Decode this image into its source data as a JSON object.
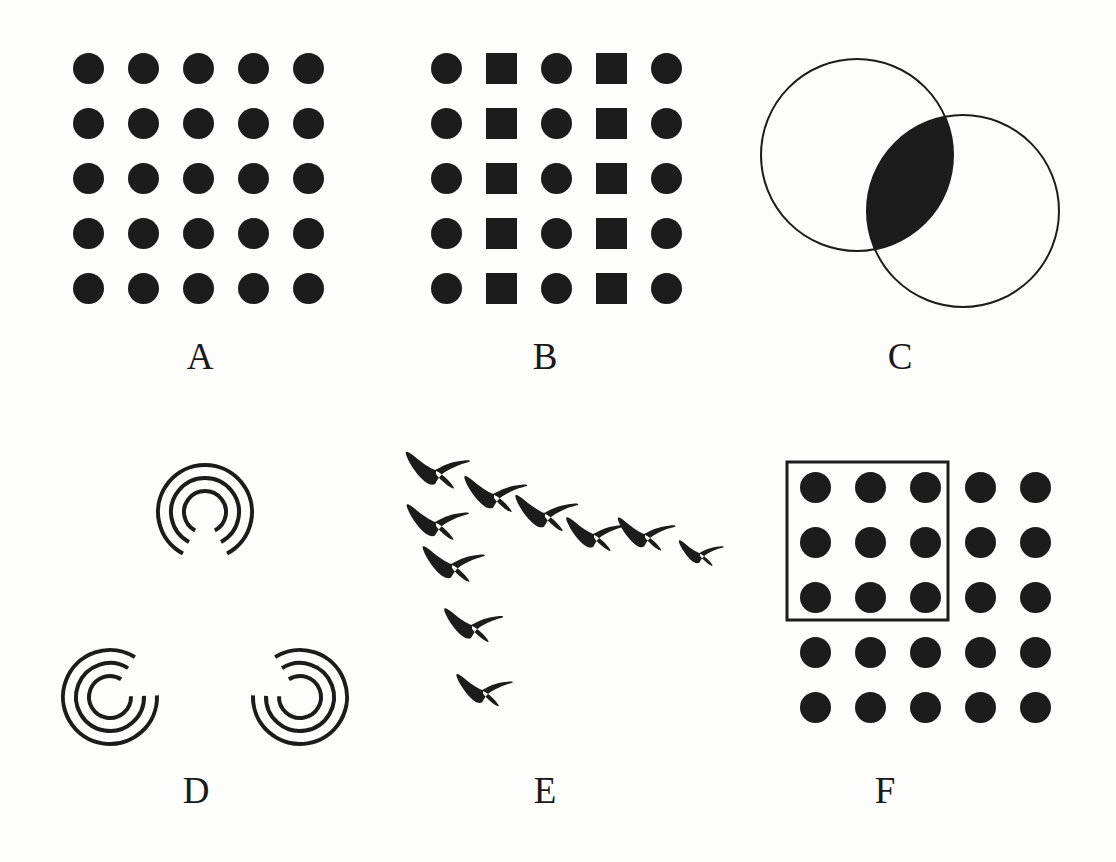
{
  "figure": {
    "background_color": "#fdfdfc",
    "ink_color": "#1c1c1c",
    "width": 1116,
    "height": 862
  },
  "panels": [
    {
      "id": "A",
      "label": "A",
      "label_x": 170,
      "label_y": 338,
      "type": "dot-grid",
      "description": "5 by 5 grid of identical filled circles",
      "origin_x": 88,
      "origin_y": 68,
      "col_step": 55,
      "row_step": 55,
      "rows": 5,
      "cols": 5,
      "marker_size": 31,
      "cell_shapes": [
        [
          "circle",
          "circle",
          "circle",
          "circle",
          "circle"
        ],
        [
          "circle",
          "circle",
          "circle",
          "circle",
          "circle"
        ],
        [
          "circle",
          "circle",
          "circle",
          "circle",
          "circle"
        ],
        [
          "circle",
          "circle",
          "circle",
          "circle",
          "circle"
        ],
        [
          "circle",
          "circle",
          "circle",
          "circle",
          "circle"
        ]
      ]
    },
    {
      "id": "B",
      "label": "B",
      "label_x": 515,
      "label_y": 338,
      "type": "dot-grid",
      "description": "5 by 5 grid alternating columns of circles and squares",
      "origin_x": 446,
      "origin_y": 68,
      "col_step": 55,
      "row_step": 55,
      "rows": 5,
      "cols": 5,
      "marker_size": 31,
      "cell_shapes": [
        [
          "circle",
          "square",
          "circle",
          "square",
          "circle"
        ],
        [
          "circle",
          "square",
          "circle",
          "square",
          "circle"
        ],
        [
          "circle",
          "square",
          "circle",
          "square",
          "circle"
        ],
        [
          "circle",
          "square",
          "circle",
          "square",
          "circle"
        ],
        [
          "circle",
          "square",
          "circle",
          "square",
          "circle"
        ]
      ]
    },
    {
      "id": "C",
      "label": "C",
      "label_x": 870,
      "label_y": 338,
      "type": "venn",
      "description": "Two overlapping outlined circles with filled lens intersection",
      "circles": [
        {
          "cx": 857,
          "cy": 155,
          "r": 96
        },
        {
          "cx": 963,
          "cy": 211,
          "r": 96
        }
      ],
      "stroke_width": 2,
      "intersection_filled": true
    },
    {
      "id": "D",
      "label": "D",
      "label_x": 166,
      "label_y": 772,
      "type": "arc-triad",
      "description": "Three concentric-arc inducers forming an illusory triangle",
      "elements": [
        {
          "cx": 205,
          "cy": 512,
          "gap_center_deg": 90,
          "radii": [
            21,
            34,
            47
          ],
          "gap_deg": 56
        },
        {
          "cx": 110,
          "cy": 697,
          "gap_center_deg": 330,
          "radii": [
            21,
            34,
            47
          ],
          "gap_deg": 56
        },
        {
          "cx": 300,
          "cy": 697,
          "gap_center_deg": 210,
          "radii": [
            21,
            34,
            47
          ],
          "gap_deg": 56
        }
      ],
      "stroke_width": 4
    },
    {
      "id": "E",
      "label": "E",
      "label_x": 515,
      "label_y": 772,
      "type": "bird-flock",
      "description": "Ten bird silhouettes arranged in a V formation",
      "birds": [
        {
          "x": 436,
          "y": 470,
          "scale": 1.0
        },
        {
          "x": 494,
          "y": 494,
          "scale": 0.98
        },
        {
          "x": 436,
          "y": 522,
          "scale": 0.97
        },
        {
          "x": 545,
          "y": 513,
          "scale": 0.98
        },
        {
          "x": 594,
          "y": 534,
          "scale": 0.92
        },
        {
          "x": 645,
          "y": 534,
          "scale": 0.9
        },
        {
          "x": 452,
          "y": 564,
          "scale": 0.97
        },
        {
          "x": 700,
          "y": 553,
          "scale": 0.7
        },
        {
          "x": 472,
          "y": 625,
          "scale": 0.92
        },
        {
          "x": 483,
          "y": 690,
          "scale": 0.88
        }
      ]
    },
    {
      "id": "F",
      "label": "F",
      "label_x": 855,
      "label_y": 772,
      "type": "dot-grid-with-frame",
      "description": "5 by 5 dot grid with a rectangular outline enclosing the top-left 3 by 3 dots",
      "origin_x": 815,
      "origin_y": 487,
      "col_step": 55,
      "row_step": 55,
      "rows": 5,
      "cols": 5,
      "marker_size": 31,
      "cell_shapes": [
        [
          "circle",
          "circle",
          "circle",
          "circle",
          "circle"
        ],
        [
          "circle",
          "circle",
          "circle",
          "circle",
          "circle"
        ],
        [
          "circle",
          "circle",
          "circle",
          "circle",
          "circle"
        ],
        [
          "circle",
          "circle",
          "circle",
          "circle",
          "circle"
        ],
        [
          "circle",
          "circle",
          "circle",
          "circle",
          "circle"
        ]
      ],
      "frame": {
        "x": 787,
        "y": 462,
        "width": 161,
        "height": 158,
        "stroke_width": 3
      }
    }
  ]
}
